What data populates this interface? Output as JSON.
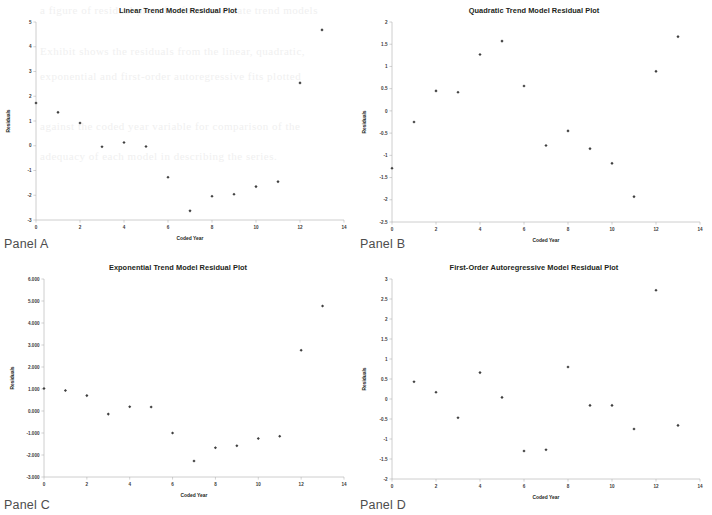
{
  "page": {
    "bleed_text_lines": [
      "a figure of residual plots for four candidate trend models",
      "Exhibit shows the residuals from the linear, quadratic,",
      "exponential and first-order autoregressive fits plotted",
      "against the coded year variable for comparison of the",
      "adequacy of each model in describing the series."
    ]
  },
  "panels": [
    {
      "id": "panel-a",
      "label": "Panel A",
      "chart_data": {
        "type": "scatter",
        "title": "Linear Trend Model Residual Plot",
        "xlabel": "Coded Year",
        "ylabel": "Residuals",
        "xlim": [
          0,
          14
        ],
        "ylim": [
          -3,
          5
        ],
        "xticks": [
          "0",
          "2",
          "4",
          "6",
          "8",
          "10",
          "12",
          "14"
        ],
        "xtick_values": [
          0,
          2,
          4,
          6,
          8,
          10,
          12,
          14
        ],
        "yticks": [
          "-3",
          "-2",
          "-1",
          "0",
          "1",
          "2",
          "3",
          "4",
          "5"
        ],
        "ytick_values": [
          -3,
          -2,
          -1,
          0,
          1,
          2,
          3,
          4,
          5
        ],
        "grid": false,
        "legend": "none",
        "x": [
          0,
          1,
          2,
          3,
          4,
          5,
          6,
          7,
          8,
          9,
          10,
          11,
          12,
          13
        ],
        "values": [
          1.73,
          1.35,
          0.92,
          -0.04,
          0.13,
          -0.03,
          -1.27,
          -2.63,
          -2.04,
          -1.96,
          -1.65,
          -1.45,
          2.54,
          4.68
        ]
      }
    },
    {
      "id": "panel-b",
      "label": "Panel B",
      "chart_data": {
        "type": "scatter",
        "title": "Quadratic Trend Model Residual Plot",
        "xlabel": "Coded Year",
        "ylabel": "Residuals",
        "xlim": [
          0,
          14
        ],
        "ylim": [
          -2.5,
          2
        ],
        "xticks": [
          "0",
          "2",
          "4",
          "6",
          "8",
          "10",
          "12",
          "14"
        ],
        "xtick_values": [
          0,
          2,
          4,
          6,
          8,
          10,
          12,
          14
        ],
        "yticks": [
          "-2.5",
          "-2",
          "-1.5",
          "-1",
          "-0.5",
          "0",
          "0.5",
          "1",
          "1.5",
          "2"
        ],
        "ytick_values": [
          -2.5,
          -2,
          -1.5,
          -1,
          -0.5,
          0,
          0.5,
          1,
          1.5,
          2
        ],
        "grid": false,
        "legend": "none",
        "x": [
          0,
          1,
          2,
          3,
          4,
          5,
          6,
          7,
          8,
          9,
          10,
          11,
          12,
          13
        ],
        "values": [
          -1.29,
          -0.25,
          0.45,
          0.42,
          1.27,
          1.57,
          0.56,
          -0.78,
          -0.45,
          -0.85,
          -1.18,
          -1.93,
          0.89,
          1.67
        ]
      }
    },
    {
      "id": "panel-c",
      "label": "Panel C",
      "chart_data": {
        "type": "scatter",
        "title": "Exponential Trend Model Residual Plot",
        "xlabel": "Coded Year",
        "ylabel": "Residuals",
        "xlim": [
          0,
          14
        ],
        "ylim": [
          -3,
          6
        ],
        "xticks": [
          "0",
          "2",
          "4",
          "6",
          "8",
          "10",
          "12",
          "14"
        ],
        "xtick_values": [
          0,
          2,
          4,
          6,
          8,
          10,
          12,
          14
        ],
        "yticks": [
          "-3.000",
          "-2.000",
          "-1.000",
          "0.000",
          "1.000",
          "2.000",
          "3.000",
          "4.000",
          "5.000",
          "6.000"
        ],
        "ytick_values": [
          -3,
          -2,
          -1,
          0,
          1,
          2,
          3,
          4,
          5,
          6
        ],
        "grid": false,
        "legend": "none",
        "x": [
          0,
          1,
          2,
          3,
          4,
          5,
          6,
          7,
          8,
          9,
          10,
          11,
          12,
          13
        ],
        "values": [
          1.02,
          0.93,
          0.7,
          -0.14,
          0.19,
          0.18,
          -1.0,
          -2.27,
          -1.67,
          -1.58,
          -1.25,
          -1.15,
          2.76,
          4.77
        ]
      }
    },
    {
      "id": "panel-d",
      "label": "Panel D",
      "chart_data": {
        "type": "scatter",
        "title": "First-Order Autoregressive Model Residual Plot",
        "xlabel": "Coded Year",
        "ylabel": "Residuals",
        "xlim": [
          0,
          14
        ],
        "ylim": [
          -2,
          3
        ],
        "xticks": [
          "0",
          "2",
          "4",
          "6",
          "8",
          "10",
          "12",
          "14"
        ],
        "xtick_values": [
          0,
          2,
          4,
          6,
          8,
          10,
          12,
          14
        ],
        "yticks": [
          "-2",
          "-1.5",
          "-1",
          "-0.5",
          "0",
          "0.5",
          "1",
          "1.5",
          "2",
          "2.5",
          "3"
        ],
        "ytick_values": [
          -2,
          -1.5,
          -1,
          -0.5,
          0,
          0.5,
          1,
          1.5,
          2,
          2.5,
          3
        ],
        "grid": false,
        "legend": "none",
        "x": [
          1,
          2,
          3,
          4,
          5,
          6,
          7,
          8,
          9,
          10,
          11,
          12,
          13
        ],
        "values": [
          0.43,
          0.17,
          -0.47,
          0.66,
          0.04,
          -1.3,
          -1.27,
          0.8,
          -0.16,
          -0.16,
          -0.75,
          2.72,
          -0.66
        ]
      }
    }
  ]
}
